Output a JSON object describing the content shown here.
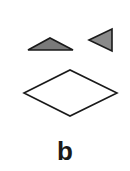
{
  "figure": {
    "panel_label": "b",
    "shapes": [
      {
        "name": "flat-triangle",
        "fill": "#7a7a7a",
        "stroke": "#1a1a1a",
        "points": "28,50 50,38 73,50"
      },
      {
        "name": "left-pointing-triangle",
        "fill": "#8a8a8a",
        "stroke": "#1a1a1a",
        "points": "89,40 112,29 112,51"
      },
      {
        "name": "diamond",
        "fill": "#ffffff",
        "stroke": "#1a1a1a",
        "points": "24,93 70,70 117,93 70,116"
      }
    ]
  }
}
